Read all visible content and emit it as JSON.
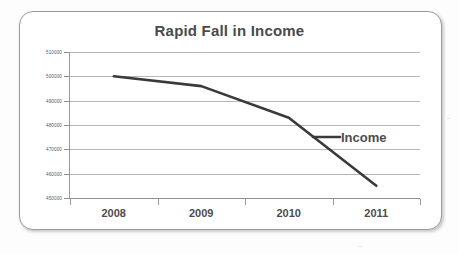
{
  "chart_data": {
    "type": "line",
    "title": "Rapid Fall in Income",
    "xlabel": "",
    "ylabel": "",
    "categories": [
      "2008",
      "2009",
      "2010",
      "2011"
    ],
    "series": [
      {
        "name": "Income",
        "values": [
          500000,
          496000,
          483000,
          455000
        ]
      }
    ],
    "ylim": [
      450000,
      510000
    ],
    "ytick_values": [
      510000,
      500000,
      490000,
      480000,
      470000,
      460000,
      450000
    ],
    "ytick_labels": [
      "510000",
      "500000",
      "490000",
      "480000",
      "470000",
      "460000",
      "450000"
    ],
    "grid": true,
    "legend": "inline-callout",
    "legend_entries": [
      "Income"
    ],
    "colors": {
      "line": "#3a3a3a",
      "grid": "#b6b6b6",
      "axis": "#9a9a9a",
      "title_text": "#4a4a4a",
      "tick_text": "#5a5a5a",
      "frame": "#9a9a9a",
      "background": "#ffffff"
    }
  },
  "annotations": {
    "income_callout": "Income"
  }
}
